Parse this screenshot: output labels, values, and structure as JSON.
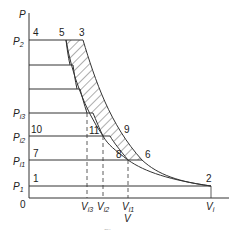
{
  "diagram": {
    "type": "pv-diagram",
    "axes": {
      "y_label": "P",
      "x_label": "V",
      "origin_label": "0"
    },
    "pressure_labels": [
      {
        "main": "P",
        "sub": "2",
        "y": 43
      },
      {
        "main": "P",
        "sub": "i3",
        "y": 116
      },
      {
        "main": "P",
        "sub": "i2",
        "y": 140
      },
      {
        "main": "P",
        "sub": "i1",
        "y": 164
      },
      {
        "main": "P",
        "sub": "1",
        "y": 189
      }
    ],
    "volume_labels": [
      {
        "main": "V",
        "sub": "i3",
        "x": 86
      },
      {
        "main": "V",
        "sub": "i2",
        "x": 102
      },
      {
        "main": "V",
        "sub": "i1",
        "x": 127
      },
      {
        "main": "V",
        "sub": "i",
        "x": 210
      }
    ],
    "point_labels": [
      {
        "id": "1",
        "x": 33,
        "y": 182
      },
      {
        "id": "2",
        "x": 206,
        "y": 182
      },
      {
        "id": "3",
        "x": 79,
        "y": 36
      },
      {
        "id": "4",
        "x": 33,
        "y": 36
      },
      {
        "id": "5",
        "x": 59,
        "y": 36
      },
      {
        "id": "6",
        "x": 145,
        "y": 158
      },
      {
        "id": "7",
        "x": 33,
        "y": 157
      },
      {
        "id": "8",
        "x": 116,
        "y": 158
      },
      {
        "id": "9",
        "x": 124,
        "y": 133
      },
      {
        "id": "10",
        "x": 33,
        "y": 133
      },
      {
        "id": "11",
        "x": 90,
        "y": 134
      }
    ],
    "caption": "Fig."
  }
}
